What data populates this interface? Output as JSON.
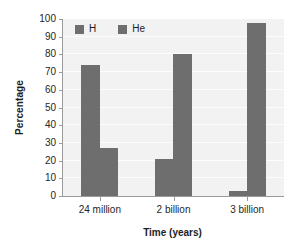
{
  "chart_data": {
    "type": "bar",
    "title": "",
    "subtitle": "",
    "xlabel": "Time (years)",
    "ylabel": "Percentage",
    "categories": [
      "24 million",
      "2 billion",
      "3 billion"
    ],
    "series": [
      {
        "name": "H",
        "values": [
          74,
          21,
          3
        ],
        "color": "#6e6e6e"
      },
      {
        "name": "He",
        "values": [
          27,
          80,
          98
        ],
        "color": "#6e6e6e"
      }
    ],
    "ylim": [
      0,
      100
    ],
    "ytick_step": 10,
    "yticks": [
      100,
      90,
      80,
      70,
      60,
      50,
      40,
      30,
      20,
      10,
      0
    ],
    "ytick_labels": [
      "100",
      "90",
      "80",
      "70",
      "60",
      "50",
      "40",
      "30",
      "20",
      "10",
      "0"
    ],
    "grid": true,
    "grid_axis": "y",
    "legend": [
      "H",
      "He"
    ],
    "legend_position": "top-left-inside",
    "plot_background": "#f2f2f2",
    "grid_color": "#ffffff",
    "axis_color": "#9a9a9a",
    "bar_color": "#6e6e6e"
  },
  "legend": {
    "entries": [
      {
        "label": "H",
        "swatch_name": "legend-swatch-h"
      },
      {
        "label": "He",
        "swatch_name": "legend-swatch-he"
      }
    ]
  },
  "axes": {
    "y_title": "Percentage",
    "x_title": "Time (years)"
  }
}
